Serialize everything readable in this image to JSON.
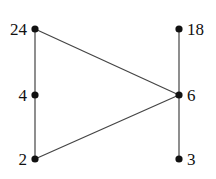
{
  "diagram": {
    "type": "hasse-diagram",
    "nodes": [
      {
        "id": "24",
        "label": "24",
        "x": 35,
        "y": 29,
        "label_side": "left"
      },
      {
        "id": "4",
        "label": "4",
        "x": 35,
        "y": 95,
        "label_side": "left"
      },
      {
        "id": "2",
        "label": "2",
        "x": 35,
        "y": 159,
        "label_side": "left"
      },
      {
        "id": "18",
        "label": "18",
        "x": 179,
        "y": 29,
        "label_side": "right"
      },
      {
        "id": "6",
        "label": "6",
        "x": 179,
        "y": 95,
        "label_side": "right"
      },
      {
        "id": "3",
        "label": "3",
        "x": 179,
        "y": 159,
        "label_side": "right"
      }
    ],
    "edges": [
      [
        "24",
        "4"
      ],
      [
        "4",
        "2"
      ],
      [
        "24",
        "6"
      ],
      [
        "2",
        "6"
      ],
      [
        "18",
        "6"
      ],
      [
        "6",
        "3"
      ]
    ]
  }
}
